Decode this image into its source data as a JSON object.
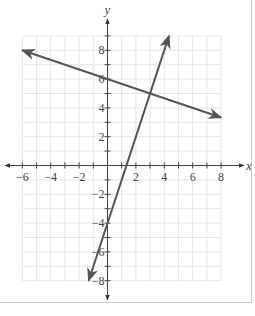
{
  "chart_data": {
    "type": "line",
    "title": "",
    "xlabel": "x",
    "ylabel": "y",
    "xlim": [
      -6,
      8
    ],
    "ylim": [
      -8,
      9
    ],
    "grid": true,
    "x_ticks": [
      -6,
      -4,
      -2,
      2,
      4,
      6,
      8
    ],
    "y_ticks": [
      -8,
      -6,
      -4,
      -2,
      2,
      4,
      6,
      8
    ],
    "x_tick_labels": [
      "−6",
      "−4",
      "−2",
      "2",
      "4",
      "6",
      "8"
    ],
    "y_tick_labels": [
      "−8",
      "−6",
      "−4",
      "−2",
      "2",
      "4",
      "6",
      "8"
    ],
    "series": [
      {
        "name": "line-1",
        "equation": "y = -x/3 + 6",
        "x": [
          -6,
          8
        ],
        "y": [
          8,
          3.33
        ],
        "arrows": "both"
      },
      {
        "name": "line-2",
        "equation": "y = 3x - 4",
        "x": [
          -1.33,
          4.33
        ],
        "y": [
          -8,
          9
        ],
        "arrows": "both"
      }
    ],
    "intersection": {
      "x": 3,
      "y": 5
    },
    "colors": {
      "line": "#555555",
      "grid": "#e6e6e6",
      "axis": "#444444"
    }
  }
}
